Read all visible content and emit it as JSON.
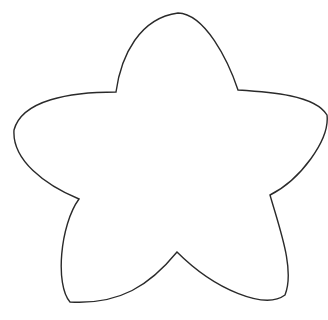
{
  "image": {
    "subject": "star-outline",
    "description": "Hand-drawn five-pointed star outline with rounded tips",
    "background_color": "#ffffff",
    "stroke_color": "#2a2a2a",
    "fill_color": "#ffffff"
  }
}
